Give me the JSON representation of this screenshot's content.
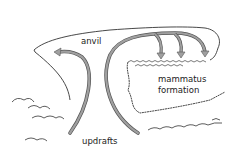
{
  "diagram": {
    "type": "illustration",
    "labels": {
      "anvil": "anvil",
      "mammatus_line1": "mammatus",
      "mammatus_line2": "formation",
      "updrafts": "updrafts"
    },
    "colors": {
      "outline": "#333333",
      "arrow_fill": "#9a9a9a",
      "arrow_stroke": "#555555",
      "background": "#ffffff"
    }
  }
}
